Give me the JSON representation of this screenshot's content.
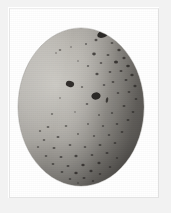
{
  "image": {
    "kind": "photographic-plate",
    "medium": "black-and-white photograph",
    "subject": "speckled bird egg",
    "caption": "",
    "background_color": "#ffffff",
    "margin_color": "#f2f2f2",
    "frame_color": "#e6e6e6"
  },
  "specimen": {
    "name": "egg",
    "shape": "oval",
    "orientation": "upright, narrow end up",
    "shell_base_color": "#a9a6a0",
    "shell_highlight_color": "#cdcbc5",
    "shell_shadow_color": "#6e6b67",
    "speckle_color": "#221f1d",
    "bounds": {
      "left": 18,
      "top": 28,
      "right": 144,
      "bottom": 186
    },
    "center": {
      "x": 81,
      "y": 107
    },
    "radius": {
      "x": 63,
      "y": 79
    },
    "description": "Pale gray oval egg densely flecked with dark spots, heaviest toward the upper right and the broad lower end."
  },
  "lighting": {
    "highlight_side": "left",
    "shadow_side": "right",
    "highlight_center": {
      "x": 46,
      "y": 78
    }
  },
  "speckles": [
    {
      "cx": 103,
      "cy": 34,
      "rx": 6.0,
      "ry": 3.4,
      "rot": -22,
      "op": 0.92
    },
    {
      "cx": 96,
      "cy": 40,
      "rx": 1.5,
      "ry": 1.2,
      "rot": 0,
      "op": 0.62
    },
    {
      "cx": 112,
      "cy": 43,
      "rx": 1.4,
      "ry": 1.1,
      "rot": 0,
      "op": 0.55
    },
    {
      "cx": 86,
      "cy": 44,
      "rx": 1.1,
      "ry": 0.9,
      "rot": 0,
      "op": 0.5
    },
    {
      "cx": 119,
      "cy": 50,
      "rx": 1.7,
      "ry": 1.3,
      "rot": 0,
      "op": 0.7
    },
    {
      "cx": 71,
      "cy": 47,
      "rx": 1.0,
      "ry": 0.8,
      "rot": 0,
      "op": 0.42
    },
    {
      "cx": 60,
      "cy": 50,
      "rx": 1.3,
      "ry": 0.9,
      "rot": 0,
      "op": 0.46
    },
    {
      "cx": 56,
      "cy": 53,
      "rx": 1.1,
      "ry": 0.8,
      "rot": 0,
      "op": 0.4
    },
    {
      "cx": 94,
      "cy": 54,
      "rx": 1.8,
      "ry": 1.4,
      "rot": 0,
      "op": 0.72
    },
    {
      "cx": 108,
      "cy": 55,
      "rx": 1.5,
      "ry": 1.1,
      "rot": 0,
      "op": 0.6
    },
    {
      "cx": 124,
      "cy": 58,
      "rx": 1.6,
      "ry": 1.2,
      "rot": 0,
      "op": 0.66
    },
    {
      "cx": 116,
      "cy": 62,
      "rx": 2.0,
      "ry": 1.5,
      "rot": 0,
      "op": 0.78
    },
    {
      "cx": 101,
      "cy": 63,
      "rx": 1.3,
      "ry": 1.0,
      "rot": 0,
      "op": 0.55
    },
    {
      "cx": 88,
      "cy": 66,
      "rx": 1.2,
      "ry": 0.9,
      "rot": 0,
      "op": 0.5
    },
    {
      "cx": 78,
      "cy": 61,
      "rx": 1.0,
      "ry": 0.8,
      "rot": 0,
      "op": 0.4
    },
    {
      "cx": 128,
      "cy": 66,
      "rx": 1.8,
      "ry": 1.3,
      "rot": 0,
      "op": 0.74
    },
    {
      "cx": 121,
      "cy": 71,
      "rx": 1.5,
      "ry": 1.1,
      "rot": 0,
      "op": 0.64
    },
    {
      "cx": 110,
      "cy": 72,
      "rx": 1.4,
      "ry": 1.1,
      "rot": 0,
      "op": 0.58
    },
    {
      "cx": 97,
      "cy": 74,
      "rx": 1.6,
      "ry": 1.2,
      "rot": 0,
      "op": 0.66
    },
    {
      "cx": 132,
      "cy": 75,
      "rx": 1.7,
      "ry": 1.2,
      "rot": 0,
      "op": 0.7
    },
    {
      "cx": 126,
      "cy": 80,
      "rx": 1.5,
      "ry": 1.1,
      "rot": 0,
      "op": 0.62
    },
    {
      "cx": 113,
      "cy": 82,
      "rx": 1.4,
      "ry": 1.0,
      "rot": 0,
      "op": 0.58
    },
    {
      "cx": 104,
      "cy": 85,
      "rx": 1.3,
      "ry": 1.0,
      "rot": 0,
      "op": 0.54
    },
    {
      "cx": 135,
      "cy": 86,
      "rx": 1.6,
      "ry": 1.2,
      "rot": 0,
      "op": 0.66
    },
    {
      "cx": 70,
      "cy": 84,
      "rx": 4.2,
      "ry": 3.0,
      "rot": 15,
      "op": 0.9
    },
    {
      "cx": 82,
      "cy": 87,
      "rx": 1.2,
      "ry": 0.9,
      "rot": 0,
      "op": 0.48
    },
    {
      "cx": 129,
      "cy": 92,
      "rx": 1.4,
      "ry": 1.0,
      "rot": 0,
      "op": 0.58
    },
    {
      "cx": 118,
      "cy": 93,
      "rx": 1.3,
      "ry": 1.0,
      "rot": 0,
      "op": 0.54
    },
    {
      "cx": 96,
      "cy": 96,
      "rx": 4.6,
      "ry": 3.6,
      "rot": -10,
      "op": 0.92
    },
    {
      "cx": 107,
      "cy": 100,
      "rx": 1.2,
      "ry": 2.8,
      "rot": 10,
      "op": 0.76
    },
    {
      "cx": 136,
      "cy": 99,
      "rx": 1.4,
      "ry": 1.0,
      "rot": 0,
      "op": 0.56
    },
    {
      "cx": 60,
      "cy": 98,
      "rx": 1.1,
      "ry": 0.8,
      "rot": 0,
      "op": 0.42
    },
    {
      "cx": 87,
      "cy": 104,
      "rx": 1.3,
      "ry": 1.0,
      "rot": 0,
      "op": 0.54
    },
    {
      "cx": 124,
      "cy": 106,
      "rx": 1.5,
      "ry": 1.1,
      "rot": 0,
      "op": 0.6
    },
    {
      "cx": 133,
      "cy": 112,
      "rx": 1.4,
      "ry": 1.0,
      "rot": 0,
      "op": 0.56
    },
    {
      "cx": 112,
      "cy": 113,
      "rx": 1.2,
      "ry": 0.9,
      "rot": 0,
      "op": 0.5
    },
    {
      "cx": 99,
      "cy": 115,
      "rx": 1.1,
      "ry": 0.9,
      "rot": 0,
      "op": 0.46
    },
    {
      "cx": 75,
      "cy": 112,
      "rx": 1.0,
      "ry": 0.8,
      "rot": 0,
      "op": 0.4
    },
    {
      "cx": 52,
      "cy": 114,
      "rx": 1.2,
      "ry": 0.9,
      "rot": 0,
      "op": 0.44
    },
    {
      "cx": 128,
      "cy": 120,
      "rx": 1.5,
      "ry": 1.1,
      "rot": 0,
      "op": 0.6
    },
    {
      "cx": 117,
      "cy": 124,
      "rx": 1.3,
      "ry": 1.0,
      "rot": 0,
      "op": 0.54
    },
    {
      "cx": 103,
      "cy": 126,
      "rx": 1.2,
      "ry": 0.9,
      "rot": 0,
      "op": 0.5
    },
    {
      "cx": 88,
      "cy": 124,
      "rx": 1.1,
      "ry": 0.9,
      "rot": 0,
      "op": 0.46
    },
    {
      "cx": 66,
      "cy": 126,
      "rx": 1.3,
      "ry": 1.0,
      "rot": 0,
      "op": 0.5
    },
    {
      "cx": 48,
      "cy": 127,
      "rx": 1.4,
      "ry": 1.1,
      "rot": 0,
      "op": 0.54
    },
    {
      "cx": 40,
      "cy": 131,
      "rx": 1.2,
      "ry": 0.9,
      "rot": 0,
      "op": 0.48
    },
    {
      "cx": 122,
      "cy": 132,
      "rx": 1.4,
      "ry": 1.0,
      "rot": 0,
      "op": 0.56
    },
    {
      "cx": 109,
      "cy": 135,
      "rx": 1.3,
      "ry": 1.0,
      "rot": 0,
      "op": 0.54
    },
    {
      "cx": 94,
      "cy": 136,
      "rx": 1.2,
      "ry": 0.9,
      "rot": 0,
      "op": 0.5
    },
    {
      "cx": 78,
      "cy": 134,
      "rx": 1.1,
      "ry": 0.9,
      "rot": 0,
      "op": 0.46
    },
    {
      "cx": 58,
      "cy": 137,
      "rx": 1.5,
      "ry": 1.1,
      "rot": 0,
      "op": 0.6
    },
    {
      "cx": 44,
      "cy": 140,
      "rx": 1.3,
      "ry": 1.0,
      "rot": 0,
      "op": 0.52
    },
    {
      "cx": 115,
      "cy": 143,
      "rx": 1.4,
      "ry": 1.0,
      "rot": 0,
      "op": 0.56
    },
    {
      "cx": 100,
      "cy": 145,
      "rx": 1.5,
      "ry": 1.1,
      "rot": 0,
      "op": 0.6
    },
    {
      "cx": 85,
      "cy": 147,
      "rx": 1.3,
      "ry": 1.0,
      "rot": 0,
      "op": 0.54
    },
    {
      "cx": 70,
      "cy": 145,
      "rx": 1.4,
      "ry": 1.1,
      "rot": 0,
      "op": 0.56
    },
    {
      "cx": 54,
      "cy": 148,
      "rx": 1.5,
      "ry": 1.1,
      "rot": 0,
      "op": 0.6
    },
    {
      "cx": 38,
      "cy": 147,
      "rx": 1.2,
      "ry": 0.9,
      "rot": 0,
      "op": 0.48
    },
    {
      "cx": 107,
      "cy": 153,
      "rx": 1.5,
      "ry": 1.1,
      "rot": 0,
      "op": 0.62
    },
    {
      "cx": 92,
      "cy": 155,
      "rx": 1.4,
      "ry": 1.0,
      "rot": 0,
      "op": 0.58
    },
    {
      "cx": 76,
      "cy": 156,
      "rx": 1.6,
      "ry": 1.2,
      "rot": 0,
      "op": 0.66
    },
    {
      "cx": 61,
      "cy": 157,
      "rx": 1.5,
      "ry": 1.1,
      "rot": 0,
      "op": 0.62
    },
    {
      "cx": 46,
      "cy": 156,
      "rx": 1.3,
      "ry": 1.0,
      "rot": 0,
      "op": 0.54
    },
    {
      "cx": 117,
      "cy": 158,
      "rx": 1.2,
      "ry": 0.9,
      "rot": 0,
      "op": 0.5
    },
    {
      "cx": 99,
      "cy": 163,
      "rx": 1.6,
      "ry": 1.2,
      "rot": 0,
      "op": 0.68
    },
    {
      "cx": 83,
      "cy": 165,
      "rx": 1.7,
      "ry": 1.3,
      "rot": 0,
      "op": 0.72
    },
    {
      "cx": 68,
      "cy": 166,
      "rx": 1.5,
      "ry": 1.1,
      "rot": 0,
      "op": 0.62
    },
    {
      "cx": 53,
      "cy": 164,
      "rx": 1.4,
      "ry": 1.0,
      "rot": 0,
      "op": 0.58
    },
    {
      "cx": 110,
      "cy": 167,
      "rx": 1.3,
      "ry": 1.0,
      "rot": 0,
      "op": 0.54
    },
    {
      "cx": 91,
      "cy": 171,
      "rx": 1.6,
      "ry": 1.2,
      "rot": 0,
      "op": 0.68
    },
    {
      "cx": 76,
      "cy": 173,
      "rx": 1.7,
      "ry": 1.3,
      "rot": 0,
      "op": 0.72
    },
    {
      "cx": 62,
      "cy": 172,
      "rx": 1.4,
      "ry": 1.0,
      "rot": 0,
      "op": 0.58
    },
    {
      "cx": 100,
      "cy": 174,
      "rx": 1.3,
      "ry": 1.0,
      "rot": 0,
      "op": 0.54
    },
    {
      "cx": 84,
      "cy": 178,
      "rx": 1.5,
      "ry": 1.1,
      "rot": 0,
      "op": 0.62
    },
    {
      "cx": 70,
      "cy": 179,
      "rx": 1.3,
      "ry": 1.0,
      "rot": 0,
      "op": 0.54
    },
    {
      "cx": 93,
      "cy": 181,
      "rx": 1.2,
      "ry": 0.9,
      "rot": 0,
      "op": 0.5
    },
    {
      "cx": 78,
      "cy": 183,
      "rx": 1.1,
      "ry": 0.8,
      "rot": 0,
      "op": 0.44
    }
  ]
}
